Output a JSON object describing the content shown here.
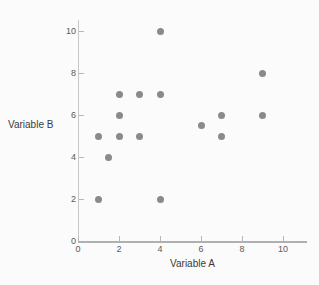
{
  "chart_data": {
    "type": "scatter",
    "title": "",
    "xlabel": "Variable A",
    "ylabel": "Variable B",
    "xlim": [
      0,
      11.2
    ],
    "ylim": [
      0,
      10.5
    ],
    "xticks": [
      0,
      2,
      4,
      6,
      8,
      10
    ],
    "yticks": [
      0,
      2,
      4,
      6,
      8,
      10
    ],
    "xtick_labels": [
      "0",
      "2",
      "4",
      "6",
      "8",
      "10"
    ],
    "ytick_labels": [
      "0",
      "2",
      "4",
      "6",
      "8",
      "10"
    ],
    "grid": false,
    "legend": false,
    "marker_color": "#8a8a8a",
    "axis_color": "#b0b0b0",
    "background_color": "#fbfbfb",
    "points": [
      {
        "x": 1,
        "y": 2
      },
      {
        "x": 1,
        "y": 5
      },
      {
        "x": 1.5,
        "y": 4
      },
      {
        "x": 2,
        "y": 5
      },
      {
        "x": 2,
        "y": 6
      },
      {
        "x": 2,
        "y": 7
      },
      {
        "x": 3,
        "y": 5
      },
      {
        "x": 3,
        "y": 7
      },
      {
        "x": 4,
        "y": 2
      },
      {
        "x": 4,
        "y": 7
      },
      {
        "x": 4,
        "y": 10
      },
      {
        "x": 6,
        "y": 5.5
      },
      {
        "x": 7,
        "y": 5
      },
      {
        "x": 7,
        "y": 6
      },
      {
        "x": 9,
        "y": 6
      },
      {
        "x": 9,
        "y": 8
      }
    ]
  }
}
